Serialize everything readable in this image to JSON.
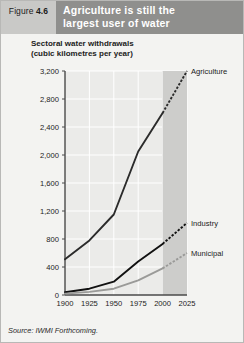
{
  "figure": {
    "tag_prefix": "Figure",
    "tag_number": "4.6",
    "title_line1": "Agriculture is still the",
    "title_line2": "largest user of water",
    "subtitle_line1": "Sectoral water withdrawals",
    "subtitle_line2": "(cubic kilometres per year)",
    "source": "Source: IWMI Forthcoming."
  },
  "colors": {
    "panel_background": "#f3f3f1",
    "tag_background": "#c9c9c7",
    "title_background": "#8f8f8d",
    "plot_background": "#ebebe9",
    "projection_band": "#cdcdcb",
    "gridline": "#ffffff",
    "axis": "#4a4a4a",
    "agriculture": "#2b2b2b",
    "industry": "#111111",
    "municipal": "#9a9a98"
  },
  "chart_data": {
    "type": "line",
    "title": "Agriculture is still the largest user of water",
    "subtitle": "Sectoral water withdrawals (cubic kilometres per year)",
    "xlabel": "",
    "ylabel": "cubic kilometres per year",
    "x": [
      1900,
      1925,
      1950,
      1975,
      2000,
      2025
    ],
    "xlim": [
      1900,
      2025
    ],
    "ylim": [
      0,
      3200
    ],
    "yticks": [
      0,
      400,
      800,
      1200,
      1600,
      2000,
      2400,
      2800,
      3200
    ],
    "ytick_labels": [
      "0",
      "400",
      "800",
      "1,200",
      "1,600",
      "2,000",
      "2,400",
      "2,800",
      "3,200"
    ],
    "xticks": [
      1900,
      1925,
      1950,
      1975,
      2000,
      2025
    ],
    "xtick_labels": [
      "1900",
      "1925",
      "1950",
      "1975",
      "2000",
      "2025"
    ],
    "grid": true,
    "grid_axis": "both",
    "legend": "inline-right-labels",
    "projection_start": 2000,
    "projection_style": "dashed",
    "projection_band_label": "forecast",
    "series": [
      {
        "name": "Agriculture",
        "label": "Agriculture",
        "color": "#2b2b2b",
        "values": [
          510,
          780,
          1150,
          2050,
          2600,
          3200
        ]
      },
      {
        "name": "Industry",
        "label": "Industry",
        "color": "#111111",
        "values": [
          40,
          90,
          190,
          480,
          730,
          1030
        ]
      },
      {
        "name": "Municipal",
        "label": "Municipal",
        "color": "#9a9a98",
        "values": [
          20,
          45,
          90,
          210,
          380,
          600
        ]
      }
    ]
  }
}
